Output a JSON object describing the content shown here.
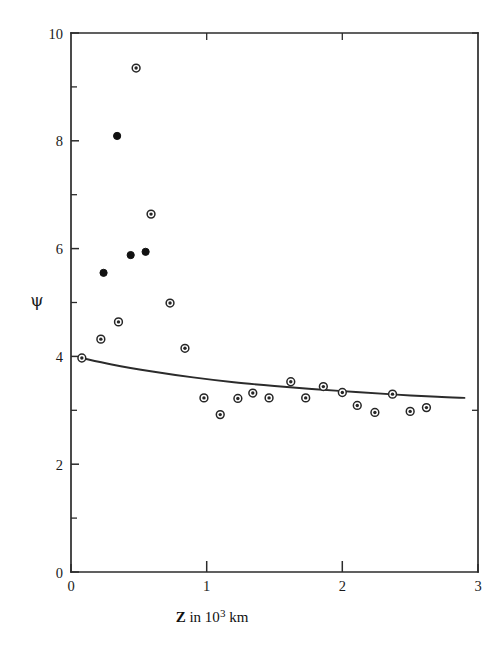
{
  "chart_data": {
    "type": "scatter",
    "title": "",
    "subtitle": "",
    "xlabel": "Z in 10³ km",
    "xlabel_parts": {
      "symbol": "Z",
      "text_before_exponent": " in 10",
      "exponent": "3",
      "text_after_exponent": " km"
    },
    "ylabel": "ψ",
    "xlim": [
      0,
      3
    ],
    "ylim": [
      0,
      10
    ],
    "xticks": [
      0,
      1,
      2,
      3
    ],
    "xtick_labels": [
      "0",
      "1",
      "2",
      "3"
    ],
    "xticks_minor": [
      0.5,
      1.5,
      2.5
    ],
    "yticks": [
      0,
      2,
      4,
      6,
      8,
      10
    ],
    "ytick_labels": [
      "0",
      "2",
      "4",
      "6",
      "8",
      "10"
    ],
    "yticks_minor": [
      1,
      3,
      5,
      7,
      9
    ],
    "grid": false,
    "legend_position": "none",
    "frame": "box",
    "tick_direction": "in",
    "series": [
      {
        "name": "open-ring points",
        "marker": "ring",
        "x": [
          0.08,
          0.22,
          0.35,
          0.48,
          0.59,
          0.73,
          0.84,
          0.98,
          1.1,
          1.23,
          1.34,
          1.46,
          1.62,
          1.73,
          1.86,
          2.0,
          2.11,
          2.24,
          2.37,
          2.5,
          2.62
        ],
        "y": [
          3.97,
          4.32,
          4.64,
          9.35,
          6.64,
          4.99,
          4.15,
          3.23,
          2.92,
          3.22,
          3.32,
          3.23,
          3.53,
          3.23,
          3.44,
          3.33,
          3.09,
          2.96,
          3.3,
          2.98,
          3.05
        ]
      },
      {
        "name": "solid points",
        "marker": "filled-circle",
        "x": [
          0.24,
          0.34,
          0.44,
          0.55
        ],
        "y": [
          5.55,
          8.09,
          5.88,
          5.94
        ]
      }
    ],
    "fit_curve": {
      "name": "theoretical curve",
      "x": [
        0.08,
        0.3,
        0.6,
        0.9,
        1.2,
        1.5,
        1.8,
        2.1,
        2.4,
        2.7,
        2.9
      ],
      "y": [
        3.97,
        3.85,
        3.72,
        3.61,
        3.52,
        3.45,
        3.39,
        3.34,
        3.29,
        3.25,
        3.23
      ]
    },
    "colors": {
      "axis": "#2b2b2b",
      "marker_edge": "#262626",
      "marker_fill_solid": "#111111",
      "curve": "#2b2b2b",
      "background": "#ffffff"
    }
  }
}
